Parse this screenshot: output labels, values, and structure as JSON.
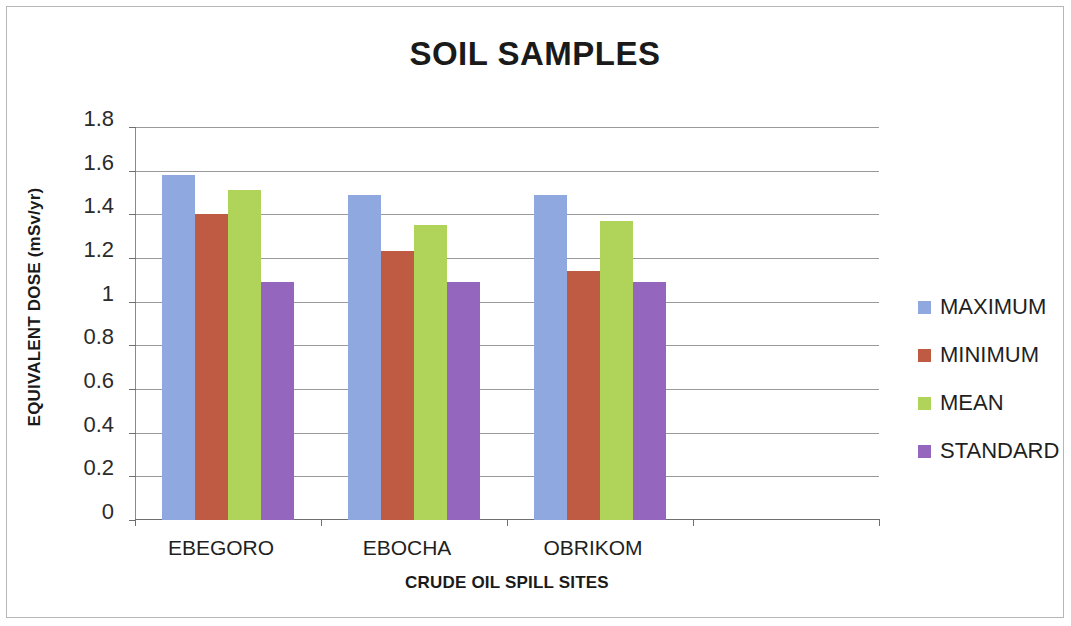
{
  "chart_data": {
    "type": "bar",
    "title": "SOIL SAMPLES",
    "xlabel": "CRUDE OIL SPILL SITES",
    "ylabel": "EQUIVALENT DOSE (mSv/yr)",
    "categories": [
      "EBEGORO",
      "EBOCHA",
      "OBRIKOM"
    ],
    "series": [
      {
        "name": "MAXIMUM",
        "color": "#8fa9e0",
        "values": [
          1.58,
          1.49,
          1.49
        ]
      },
      {
        "name": "MINIMUM",
        "color": "#c05b43",
        "values": [
          1.4,
          1.23,
          1.14
        ]
      },
      {
        "name": "MEAN",
        "color": "#b0d359",
        "values": [
          1.51,
          1.35,
          1.37
        ]
      },
      {
        "name": "STANDARD",
        "color": "#9466bd",
        "values": [
          1.09,
          1.09,
          1.09
        ]
      }
    ],
    "ylim": [
      0,
      1.8
    ],
    "ytick_labels": [
      "1.8",
      "1.6",
      "1.4",
      "1.2",
      "1",
      "0.8",
      "0.6",
      "0.4",
      "0.2",
      "0"
    ],
    "ytick_values": [
      1.8,
      1.6,
      1.4,
      1.2,
      1.0,
      0.8,
      0.6,
      0.4,
      0.2,
      0
    ],
    "grid": true,
    "legend_position": "right"
  },
  "legend": {
    "items": [
      {
        "label": "MAXIMUM",
        "color": "#8fa9e0"
      },
      {
        "label": "MINIMUM",
        "color": "#c05b43"
      },
      {
        "label": "MEAN",
        "color": "#b0d359"
      },
      {
        "label": "STANDARD",
        "color": "#9466bd"
      }
    ]
  }
}
